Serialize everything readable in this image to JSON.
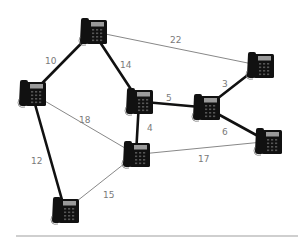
{
  "diagram": {
    "type": "weighted-graph",
    "node_icon": "desk-telephone-icon",
    "colors": {
      "heavy_edge": "#111111",
      "light_edge": "#888888",
      "label": "#7a7a7a",
      "phone_body": "#111111",
      "phone_screen": "#9a9a9a",
      "separator": "#cfcfcf"
    },
    "nodes": [
      {
        "id": "A",
        "x": 78,
        "y": 17
      },
      {
        "id": "B",
        "x": 17,
        "y": 79
      },
      {
        "id": "C",
        "x": 124,
        "y": 87
      },
      {
        "id": "D",
        "x": 245,
        "y": 51
      },
      {
        "id": "E",
        "x": 191,
        "y": 93
      },
      {
        "id": "F",
        "x": 253,
        "y": 127
      },
      {
        "id": "G",
        "x": 121,
        "y": 140
      },
      {
        "id": "H",
        "x": 50,
        "y": 196
      }
    ],
    "edges": [
      {
        "from": "A",
        "to": "B",
        "weight": "10",
        "style": "heavy",
        "label_x": 45,
        "label_y": 57
      },
      {
        "from": "A",
        "to": "C",
        "weight": "14",
        "style": "heavy",
        "label_x": 120,
        "label_y": 61
      },
      {
        "from": "A",
        "to": "D",
        "weight": "22",
        "style": "light",
        "label_x": 170,
        "label_y": 36
      },
      {
        "from": "B",
        "to": "G",
        "weight": "18",
        "style": "light",
        "label_x": 79,
        "label_y": 116
      },
      {
        "from": "B",
        "to": "H",
        "weight": "12",
        "style": "heavy",
        "label_x": 31,
        "label_y": 157
      },
      {
        "from": "C",
        "to": "E",
        "weight": "5",
        "style": "heavy",
        "label_x": 166,
        "label_y": 94
      },
      {
        "from": "C",
        "to": "G",
        "weight": "4",
        "style": "heavy",
        "label_x": 147,
        "label_y": 124
      },
      {
        "from": "E",
        "to": "D",
        "weight": "3",
        "style": "heavy",
        "label_x": 222,
        "label_y": 80
      },
      {
        "from": "E",
        "to": "F",
        "weight": "6",
        "style": "heavy",
        "label_x": 222,
        "label_y": 128
      },
      {
        "from": "G",
        "to": "F",
        "weight": "17",
        "style": "light",
        "label_x": 198,
        "label_y": 155
      },
      {
        "from": "H",
        "to": "G",
        "weight": "15",
        "style": "light",
        "label_x": 103,
        "label_y": 191
      }
    ]
  }
}
